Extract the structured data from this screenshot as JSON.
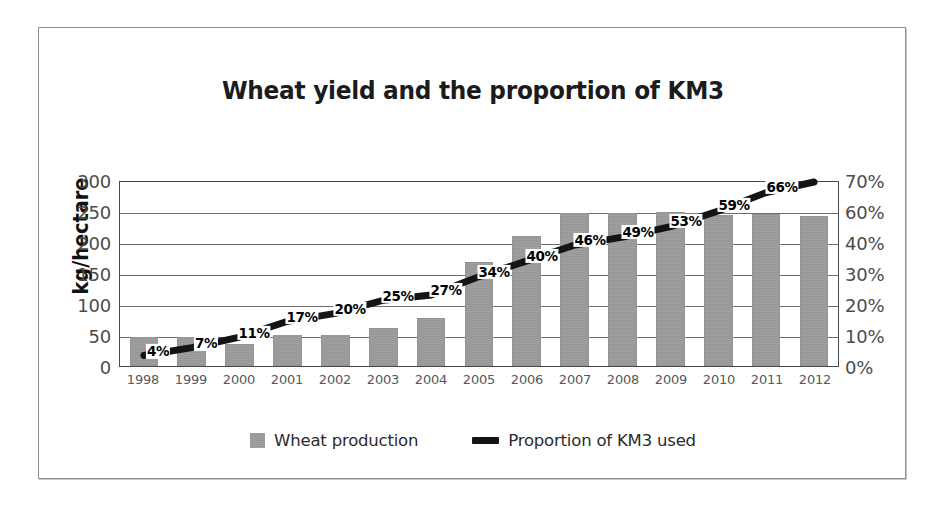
{
  "chart_data": {
    "type": "bar",
    "title": "Wheat yield and the proportion of KM3",
    "xlabel": "",
    "ylabel": "kg/hectare",
    "ylabel_right": "",
    "categories": [
      "1998",
      "1999",
      "2000",
      "2001",
      "2002",
      "2003",
      "2004",
      "2005",
      "2006",
      "2007",
      "2008",
      "2009",
      "2010",
      "2011",
      "2012"
    ],
    "series": [
      {
        "name": "Wheat production",
        "type": "bar",
        "axis": "left",
        "color": "#9b9b9b",
        "values": [
          47,
          47,
          36,
          50,
          50,
          62,
          78,
          168,
          210,
          247,
          246,
          248,
          243,
          245,
          242
        ]
      },
      {
        "name": "Proportion of KM3 used",
        "type": "line",
        "axis": "right",
        "color": "#141414",
        "values": [
          4,
          7,
          11,
          17,
          20,
          25,
          27,
          34,
          40,
          46,
          49,
          53,
          59,
          66,
          70
        ],
        "data_labels": [
          "4%",
          "7%",
          "11%",
          "17%",
          "20%",
          "25%",
          "27%",
          "34%",
          "40%",
          "46%",
          "49%",
          "53%",
          "59%",
          "66%",
          ""
        ]
      }
    ],
    "ylim": [
      0,
      300
    ],
    "yticks": [
      0,
      50,
      100,
      150,
      200,
      250,
      300
    ],
    "ytick_labels": [
      "0",
      "50",
      "100",
      "150",
      "200",
      "250",
      "300"
    ],
    "ylim_right": [
      0,
      70
    ],
    "yticks_right": [
      0,
      10,
      20,
      30,
      40,
      60,
      70
    ],
    "ytick_labels_right": [
      "0%",
      "10%",
      "20%",
      "30%",
      "40%",
      "60%",
      "70%"
    ],
    "grid": true,
    "legend_position": "bottom"
  },
  "legend": {
    "items": [
      {
        "label": "Wheat production",
        "marker": "square-swatch-icon"
      },
      {
        "label": "Proportion of KM3 used",
        "marker": "line-swatch-icon"
      }
    ]
  }
}
